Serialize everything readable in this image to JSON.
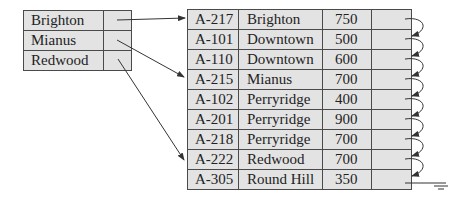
{
  "index": {
    "entries": [
      {
        "key": "Brighton"
      },
      {
        "key": "Mianus"
      },
      {
        "key": "Redwood"
      }
    ]
  },
  "file": {
    "records": [
      {
        "account": "A-217",
        "branch": "Brighton",
        "balance": "750"
      },
      {
        "account": "A-101",
        "branch": "Downtown",
        "balance": "500"
      },
      {
        "account": "A-110",
        "branch": "Downtown",
        "balance": "600"
      },
      {
        "account": "A-215",
        "branch": "Mianus",
        "balance": "700"
      },
      {
        "account": "A-102",
        "branch": "Perryridge",
        "balance": "400"
      },
      {
        "account": "A-201",
        "branch": "Perryridge",
        "balance": "900"
      },
      {
        "account": "A-218",
        "branch": "Perryridge",
        "balance": "700"
      },
      {
        "account": "A-222",
        "branch": "Redwood",
        "balance": "700"
      },
      {
        "account": "A-305",
        "branch": "Round Hill",
        "balance": "350"
      }
    ]
  },
  "colors": {
    "cell_fill": "#e3e3e3",
    "border": "#4a4a4a",
    "arrow": "#333333"
  }
}
